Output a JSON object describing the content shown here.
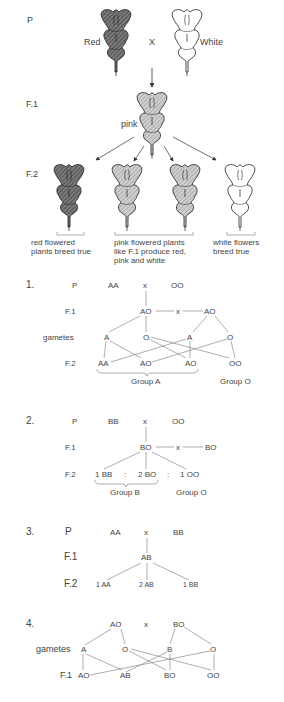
{
  "figure": {
    "parental": {
      "generation_label": "P",
      "left_label": "Red",
      "cross_symbol": "X",
      "right_label": "White"
    },
    "f1": {
      "generation_label": "F.1",
      "flower_label": "pink"
    },
    "f2": {
      "generation_label": "F.2",
      "captions": [
        "red flowered\nplants breed true",
        "pink flowered plants\nlike F.1 produce red,\npink and white",
        "white flowers\nbreed true"
      ],
      "caption_lines": {
        "red": [
          "red flowered",
          "plants breed true"
        ],
        "pink": [
          "pink flowered plants",
          "like F.1 produce red,",
          "pink and white"
        ],
        "white": [
          "white flowers",
          "breed true"
        ]
      }
    },
    "flower_colors": {
      "red": "#6e6e6e",
      "pink": "#b8b8b8",
      "white": "#ffffff"
    }
  },
  "crosses": [
    {
      "number": "1.",
      "rows": {
        "p": {
          "label": "P",
          "left": "AA",
          "cross": "x",
          "right": "OO"
        },
        "f1": {
          "label": "F.1",
          "left": "AO",
          "cross": "x",
          "right": "AO"
        },
        "gametes": {
          "label": "gametes",
          "items": [
            "A",
            "O",
            "A",
            "O"
          ]
        },
        "f2": {
          "label": "F.2",
          "items": [
            "AA",
            "AO",
            "AO",
            "OO"
          ]
        }
      },
      "groups": [
        "Group A",
        "Group O"
      ]
    },
    {
      "number": "2.",
      "rows": {
        "p": {
          "label": "P",
          "left": "BB",
          "cross": "x",
          "right": "OO"
        },
        "f1": {
          "label": "F.1",
          "left": "BO",
          "cross": "x",
          "right": "BO"
        },
        "f2": {
          "label": "F.2",
          "items": [
            "1 BB",
            ":",
            "2 BO",
            ":",
            "1 OO"
          ]
        }
      },
      "groups": [
        "Group B",
        "Group O"
      ]
    },
    {
      "number": "3.",
      "rows": {
        "p": {
          "label": "P",
          "left": "AA",
          "cross": "x",
          "right": "BB"
        },
        "f1": {
          "label": "F.1",
          "center": "AB"
        },
        "f2": {
          "label": "F.2",
          "items": [
            "1 AA",
            "2 AB",
            "1 BB"
          ]
        }
      }
    },
    {
      "number": "4.",
      "rows": {
        "p": {
          "left": "AO",
          "cross": "x",
          "right": "BO"
        },
        "gametes": {
          "label": "gametes",
          "items": [
            "A",
            "O",
            "B",
            "O"
          ]
        },
        "f1": {
          "label": "F.1",
          "items": [
            "AO",
            "AB",
            "BO",
            "OO"
          ]
        }
      }
    }
  ]
}
